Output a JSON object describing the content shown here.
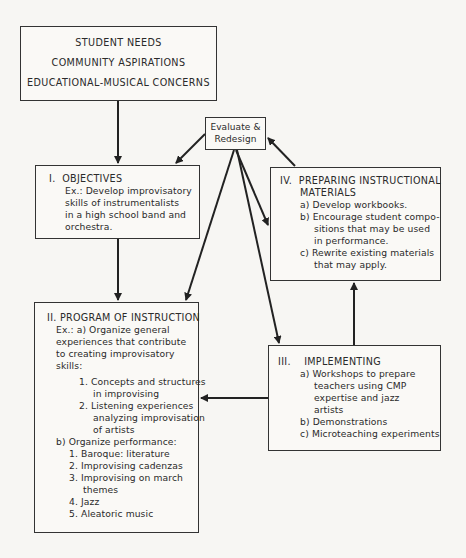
{
  "diagram": {
    "inputs_box": {
      "lines": [
        "STUDENT NEEDS",
        "COMMUNITY ASPIRATIONS",
        "EDUCATIONAL-MUSICAL CONCERNS"
      ]
    },
    "evaluate_box": {
      "lines": [
        "Evaluate &",
        "Redesign"
      ]
    },
    "objectives_box": {
      "number": "I.",
      "title": "OBJECTIVES",
      "lines": [
        "Ex.: Develop improvisatory",
        "skills of instrumentalists",
        "in a high school band and",
        "orchestra."
      ]
    },
    "preparing_box": {
      "number": "IV.",
      "title_lines": [
        "PREPARING INSTRUCTIONAL",
        "MATERIALS"
      ],
      "items": [
        {
          "marker": "a)",
          "lines": [
            "Develop workbooks."
          ]
        },
        {
          "marker": "b)",
          "lines": [
            "Encourage student compo-",
            "sitions that may be used",
            "in performance."
          ]
        },
        {
          "marker": "c)",
          "lines": [
            "Rewrite existing materials",
            "that may apply."
          ]
        }
      ]
    },
    "program_box": {
      "number": "II.",
      "title": "PROGRAM OF INSTRUCTION",
      "intro_lines": [
        "Ex.: a) Organize general",
        "experiences that contribute",
        "to creating improvisatory",
        "skills:"
      ],
      "a_items": [
        {
          "marker": "1.",
          "lines": [
            "Concepts and structures",
            "in improvising"
          ]
        },
        {
          "marker": "2.",
          "lines": [
            "Listening experiences",
            "analyzing improvisation",
            "of artists"
          ]
        }
      ],
      "b_label": "b) Organize performance:",
      "b_items": [
        {
          "marker": "1.",
          "lines": [
            "Baroque: literature"
          ]
        },
        {
          "marker": "2.",
          "lines": [
            "Improvising cadenzas"
          ]
        },
        {
          "marker": "3.",
          "lines": [
            "Improvising on march",
            "themes"
          ]
        },
        {
          "marker": "4.",
          "lines": [
            "Jazz"
          ]
        },
        {
          "marker": "5.",
          "lines": [
            "Aleatoric music"
          ]
        }
      ]
    },
    "implementing_box": {
      "number": "III.",
      "title": "IMPLEMENTING",
      "items": [
        {
          "marker": "a)",
          "lines": [
            "Workshops to prepare",
            "teachers using CMP",
            "expertise and jazz",
            "artists"
          ]
        },
        {
          "marker": "b)",
          "lines": [
            "Demonstrations"
          ]
        },
        {
          "marker": "c)",
          "lines": [
            "Microteaching experiments"
          ]
        }
      ]
    },
    "colors": {
      "background": "#f7f6f3",
      "line": "#222222",
      "text": "#2a2a2a"
    }
  }
}
